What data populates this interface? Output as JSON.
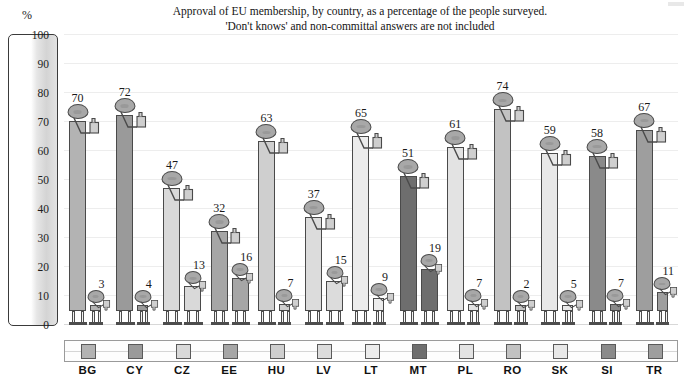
{
  "chart_data": {
    "type": "bar",
    "title": "Approval of EU membership, by country, as a percentage of the people surveyed.",
    "subtitle": "'Don't knows' and non-committal answers are not included",
    "ylabel": "%",
    "xlabel": "",
    "ylim": [
      0,
      100
    ],
    "yticks": [
      100,
      90,
      80,
      70,
      60,
      50,
      40,
      30,
      20,
      10,
      0
    ],
    "grid": true,
    "legend_position": "bottom",
    "categories": [
      "BG",
      "CY",
      "CZ",
      "EE",
      "HU",
      "LV",
      "LT",
      "MT",
      "PL",
      "RO",
      "SK",
      "SI",
      "TR"
    ],
    "series": [
      {
        "name": "Approval",
        "values": [
          70,
          72,
          47,
          32,
          63,
          37,
          65,
          51,
          61,
          74,
          59,
          58,
          67
        ]
      },
      {
        "name": "Disapproval",
        "values": [
          3,
          4,
          13,
          16,
          7,
          15,
          9,
          19,
          7,
          2,
          5,
          7,
          11
        ]
      }
    ],
    "colors": [
      "#b3b3b3",
      "#9a9a9a",
      "#d9d9d9",
      "#a6a6a6",
      "#cfcfcf",
      "#dcdcdc",
      "#ececec",
      "#6e6e6e",
      "#e3e3e3",
      "#c2c2c2",
      "#e8e8e8",
      "#8a8a8a",
      "#9e9e9e"
    ]
  },
  "countries": [
    {
      "code": "BG",
      "approval": 70,
      "disapproval": 3,
      "color": "#b3b3b3"
    },
    {
      "code": "CY",
      "approval": 72,
      "disapproval": 4,
      "color": "#9a9a9a"
    },
    {
      "code": "CZ",
      "approval": 47,
      "disapproval": 13,
      "color": "#d9d9d9"
    },
    {
      "code": "EE",
      "approval": 32,
      "disapproval": 16,
      "color": "#a6a6a6"
    },
    {
      "code": "HU",
      "approval": 63,
      "disapproval": 7,
      "color": "#cfcfcf"
    },
    {
      "code": "LV",
      "approval": 37,
      "disapproval": 15,
      "color": "#dcdcdc"
    },
    {
      "code": "LT",
      "approval": 65,
      "disapproval": 9,
      "color": "#ececec"
    },
    {
      "code": "MT",
      "approval": 51,
      "disapproval": 19,
      "color": "#6e6e6e"
    },
    {
      "code": "PL",
      "approval": 61,
      "disapproval": 7,
      "color": "#e3e3e3"
    },
    {
      "code": "RO",
      "approval": 74,
      "disapproval": 2,
      "color": "#c2c2c2"
    },
    {
      "code": "SK",
      "approval": 59,
      "disapproval": 5,
      "color": "#e8e8e8"
    },
    {
      "code": "SI",
      "approval": 58,
      "disapproval": 7,
      "color": "#8a8a8a"
    },
    {
      "code": "TR",
      "approval": 67,
      "disapproval": 11,
      "color": "#9e9e9e"
    }
  ]
}
